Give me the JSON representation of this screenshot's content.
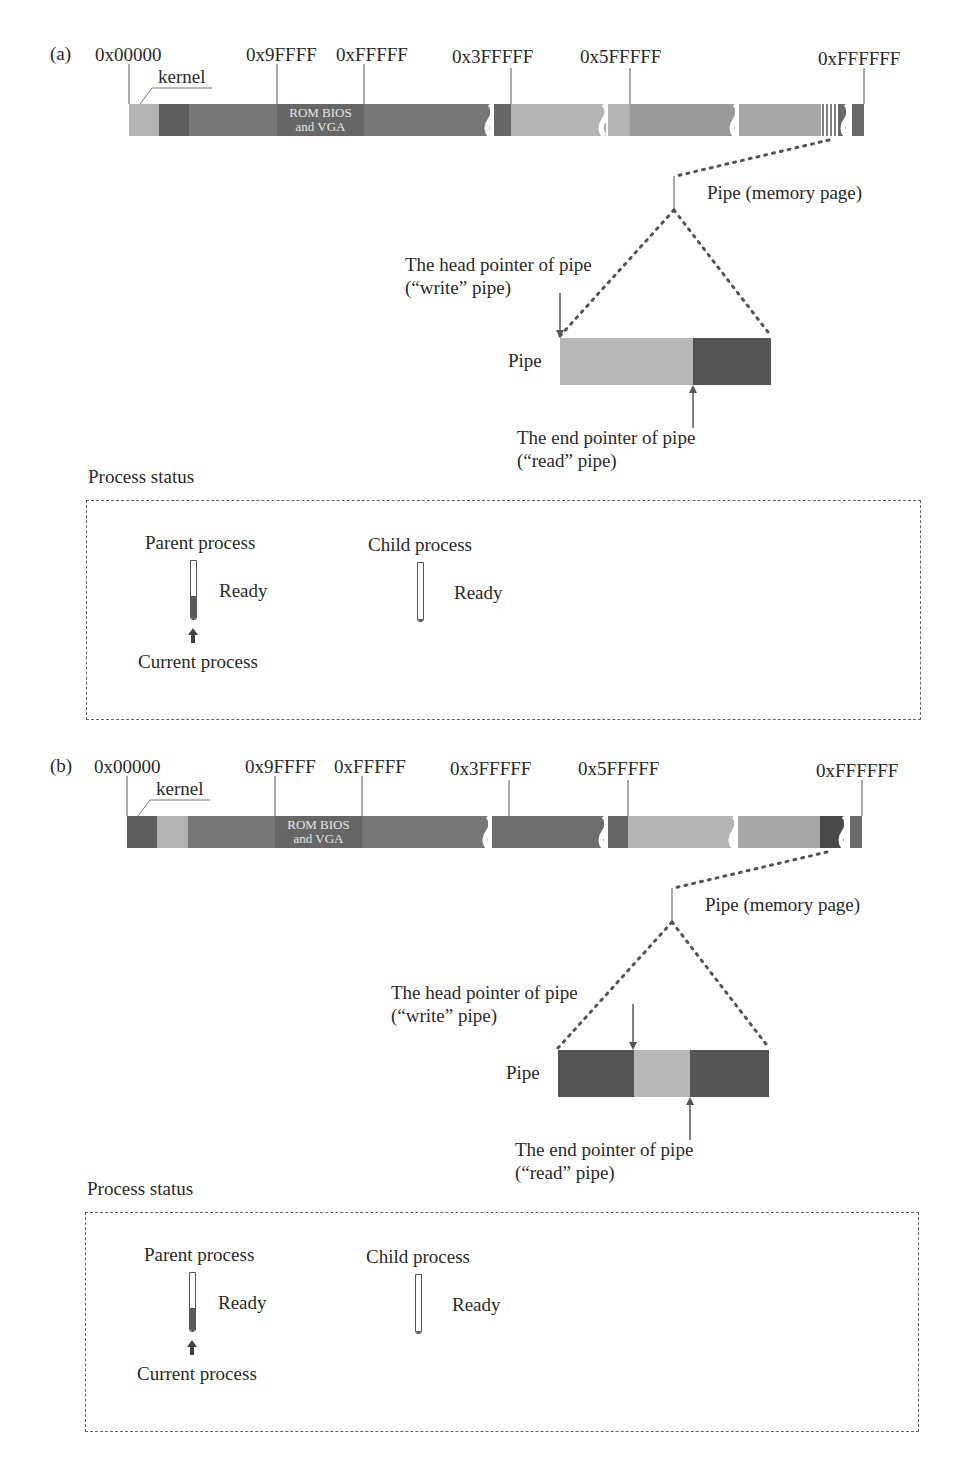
{
  "panels": [
    {
      "id": "a",
      "label": "(a)",
      "addresses": [
        "0x00000",
        "0x9FFFF",
        "0xFFFFF",
        "0x3FFFFF",
        "0x5FFFFF",
        "0xFFFFFF"
      ],
      "kernel_label": "kernel",
      "rom_label_line1": "ROM BIOS",
      "rom_label_line2": "and VGA",
      "pipe_page_label": "Pipe (memory page)",
      "head_pointer_label_line1": "The head pointer of pipe",
      "head_pointer_label_line2": "(“write” pipe)",
      "end_pointer_label_line1": "The end pointer of pipe",
      "end_pointer_label_line2": "(“read” pipe)",
      "pipe_label": "Pipe",
      "pipe_segments": [
        {
          "state": "empty",
          "fraction": 0.63,
          "color": "#b8b8b8"
        },
        {
          "state": "data",
          "fraction": 0.37,
          "color": "#555555"
        }
      ],
      "process_status_title": "Process status",
      "parent_process_label": "Parent process",
      "parent_state": "Ready",
      "child_process_label": "Child process",
      "child_state": "Ready",
      "current_process_label": "Current process"
    },
    {
      "id": "b",
      "label": "(b)",
      "addresses": [
        "0x00000",
        "0x9FFFF",
        "0xFFFFF",
        "0x3FFFFF",
        "0x5FFFFF",
        "0xFFFFFF"
      ],
      "kernel_label": "kernel",
      "rom_label_line1": "ROM BIOS",
      "rom_label_line2": "and VGA",
      "pipe_page_label": "Pipe (memory page)",
      "head_pointer_label_line1": "The head pointer of pipe",
      "head_pointer_label_line2": "(“write” pipe)",
      "end_pointer_label_line1": "The end pointer of pipe",
      "end_pointer_label_line2": "(“read” pipe)",
      "pipe_label": "Pipe",
      "pipe_segments": [
        {
          "state": "data",
          "fraction": 0.37,
          "color": "#555555"
        },
        {
          "state": "empty",
          "fraction": 0.26,
          "color": "#b8b8b8"
        },
        {
          "state": "data",
          "fraction": 0.37,
          "color": "#555555"
        }
      ],
      "process_status_title": "Process status",
      "parent_process_label": "Parent process",
      "parent_state": "Ready",
      "child_process_label": "Child process",
      "child_state": "Ready",
      "current_process_label": "Current process"
    }
  ],
  "colors": {
    "dark": "#555555",
    "medium": "#7a7a7a",
    "light": "#b4b4b4",
    "text": "#2a2a2a",
    "dotted": "#555555"
  }
}
